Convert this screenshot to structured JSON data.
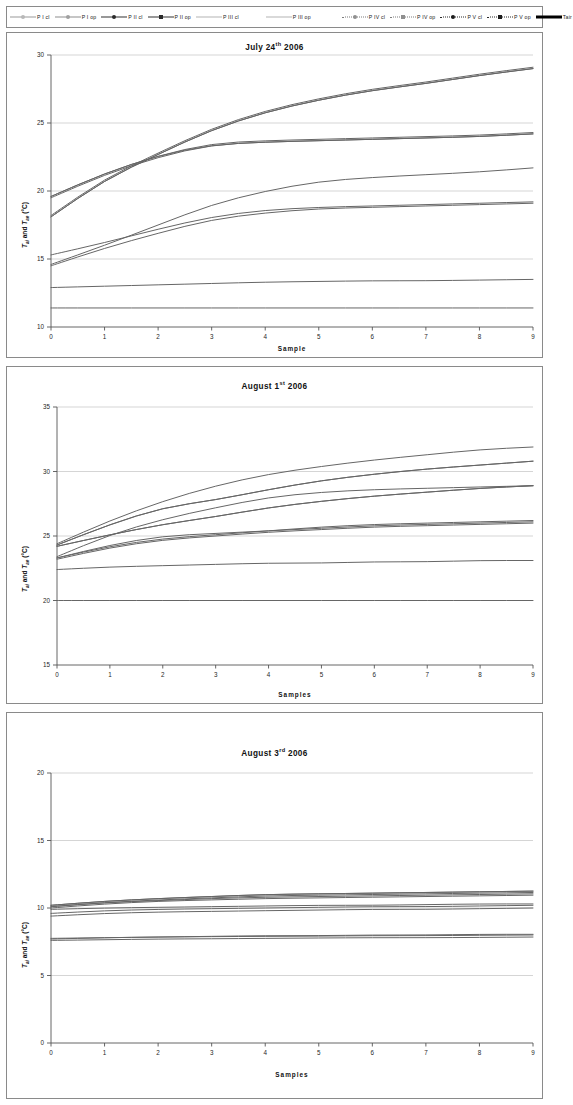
{
  "legend": {
    "items": [
      {
        "label": "P I cl",
        "marker": "circle",
        "fill": "#b8b8b8",
        "line": "solid",
        "color": "#9a9a9a",
        "width": 0.8
      },
      {
        "label": "P I op",
        "marker": "circle",
        "fill": "#a0a0a0",
        "line": "solid",
        "color": "#8d8d8d",
        "width": 0.8
      },
      {
        "label": "P II cl",
        "marker": "circle",
        "fill": "#2b2b2b",
        "line": "solid",
        "color": "#333333",
        "width": 1.2
      },
      {
        "label": "P II op",
        "marker": "square",
        "fill": "#2b2b2b",
        "line": "solid",
        "color": "#333333",
        "width": 1.2
      },
      {
        "label": "P III cl",
        "marker": "none",
        "fill": "#9f9f9f",
        "line": "solid",
        "color": "#b4b4b4",
        "width": 0.7
      },
      {
        "label": "P III op",
        "marker": "none",
        "fill": "#9f9f9f",
        "line": "solid",
        "color": "#b4b4b4",
        "width": 0.7
      },
      {
        "label": "P IV cl",
        "marker": "circle",
        "fill": "#8f8f8f",
        "line": "dotted",
        "color": "#7d7d7d",
        "width": 0.9
      },
      {
        "label": "P IV op",
        "marker": "square",
        "fill": "#8f8f8f",
        "line": "dotted",
        "color": "#7d7d7d",
        "width": 0.9
      },
      {
        "label": "P V cl",
        "marker": "circle",
        "fill": "#1c1c1c",
        "line": "dotted",
        "color": "#2a2a2a",
        "width": 1.0
      },
      {
        "label": "P V op",
        "marker": "square",
        "fill": "#1c1c1c",
        "line": "dotted",
        "color": "#2a2a2a",
        "width": 1.0
      },
      {
        "label": "Tair",
        "marker": "none",
        "fill": "#000000",
        "line": "solid",
        "color": "#000000",
        "width": 2.6
      }
    ]
  },
  "axis_label_text": {
    "y_prefix": "T",
    "y_sub1": "ai",
    "y_mid": " and ",
    "y_sub2": "ae",
    "y_unit": " (°C)"
  },
  "chart_data": [
    {
      "id": "chart1",
      "type": "line",
      "title_main": "July 24",
      "title_sup": "th",
      "title_year": " 2006",
      "title": "July 24th 2006",
      "xlabel": "Sample",
      "ylabel": "Tai and Tae (°C)",
      "x": [
        0,
        1,
        2,
        3,
        4,
        5,
        6,
        7,
        8,
        9
      ],
      "xlim": [
        0,
        9
      ],
      "ylim": [
        10,
        30
      ],
      "yticks": [
        10,
        15,
        20,
        25,
        30
      ],
      "xticks": [
        0,
        1,
        2,
        3,
        4,
        5,
        6,
        7,
        8,
        9
      ],
      "grid": true,
      "series": [
        {
          "name": "P I cl",
          "values": [
            19.6,
            21.3,
            22.6,
            23.5,
            23.7,
            23.8,
            23.9,
            24.0,
            24.1,
            24.3
          ]
        },
        {
          "name": "P I op",
          "values": [
            19.5,
            21.2,
            22.5,
            23.4,
            23.6,
            23.7,
            23.8,
            23.9,
            24.0,
            24.2
          ]
        },
        {
          "name": "P II cl",
          "values": [
            18.2,
            20.9,
            22.8,
            24.6,
            25.9,
            26.8,
            27.5,
            28.0,
            28.6,
            29.1
          ]
        },
        {
          "name": "P II op",
          "values": [
            18.1,
            20.8,
            22.7,
            24.5,
            25.8,
            26.7,
            27.4,
            27.9,
            28.5,
            29.0
          ]
        },
        {
          "name": "P III cl",
          "values": [
            19.6,
            21.3,
            22.6,
            23.4,
            23.6,
            23.7,
            23.8,
            23.9,
            24.0,
            24.2
          ]
        },
        {
          "name": "P III op",
          "values": [
            18.1,
            20.8,
            22.7,
            24.5,
            25.8,
            26.7,
            27.4,
            27.9,
            28.5,
            29.0
          ]
        },
        {
          "name": "P IV cl",
          "values": [
            14.6,
            16.0,
            17.5,
            19.0,
            20.0,
            20.7,
            21.0,
            21.2,
            21.4,
            21.7
          ]
        },
        {
          "name": "P IV op",
          "values": [
            15.3,
            16.2,
            17.2,
            18.1,
            18.6,
            18.8,
            18.9,
            19.0,
            19.1,
            19.2
          ]
        },
        {
          "name": "P V cl",
          "values": [
            14.5,
            15.8,
            16.9,
            17.9,
            18.4,
            18.7,
            18.8,
            18.9,
            19.0,
            19.1
          ]
        },
        {
          "name": "P V op",
          "values": [
            12.9,
            13.0,
            13.1,
            13.2,
            13.3,
            13.35,
            13.4,
            13.4,
            13.45,
            13.5
          ]
        },
        {
          "name": "Tair",
          "values": [
            11.4,
            11.4,
            11.4,
            11.4,
            11.4,
            11.4,
            11.4,
            11.4,
            11.4,
            11.4
          ]
        }
      ]
    },
    {
      "id": "chart2",
      "type": "line",
      "title_main": "August 1",
      "title_sup": "st",
      "title_year": " 2006",
      "title": "August 1st 2006",
      "xlabel": "Samples",
      "ylabel": "Tai and Tae (°C)",
      "x": [
        0,
        1,
        2,
        3,
        4,
        5,
        6,
        7,
        8,
        9
      ],
      "xlim": [
        0,
        9
      ],
      "ylim": [
        15,
        35
      ],
      "yticks": [
        15,
        20,
        25,
        30,
        35
      ],
      "xticks": [
        0,
        1,
        2,
        3,
        4,
        5,
        6,
        7,
        8,
        9
      ],
      "grid": true,
      "series": [
        {
          "name": "P I cl",
          "values": [
            24.3,
            25.9,
            27.2,
            27.8,
            28.6,
            29.3,
            29.8,
            30.2,
            30.5,
            30.8
          ]
        },
        {
          "name": "P I op",
          "values": [
            24.2,
            25.1,
            25.9,
            26.5,
            27.2,
            27.7,
            28.1,
            28.4,
            28.7,
            28.9
          ]
        },
        {
          "name": "P II cl",
          "values": [
            24.4,
            26.2,
            27.7,
            28.9,
            29.8,
            30.4,
            30.9,
            31.3,
            31.7,
            31.9
          ]
        },
        {
          "name": "P II op",
          "values": [
            23.3,
            24.2,
            24.8,
            25.1,
            25.4,
            25.7,
            25.9,
            26.0,
            26.1,
            26.2
          ]
        },
        {
          "name": "P III cl",
          "values": [
            24.2,
            25.1,
            25.9,
            26.5,
            27.2,
            27.7,
            28.1,
            28.4,
            28.7,
            28.9
          ]
        },
        {
          "name": "P III op",
          "values": [
            24.3,
            25.9,
            27.2,
            27.8,
            28.6,
            29.3,
            29.8,
            30.2,
            30.5,
            30.8
          ]
        },
        {
          "name": "P IV cl",
          "values": [
            23.3,
            24.3,
            25.0,
            25.2,
            25.4,
            25.6,
            25.8,
            25.9,
            26.0,
            26.1
          ]
        },
        {
          "name": "P IV op",
          "values": [
            23.2,
            24.1,
            24.7,
            25.0,
            25.3,
            25.5,
            25.7,
            25.8,
            25.9,
            26.0
          ]
        },
        {
          "name": "P V cl",
          "values": [
            23.4,
            25.1,
            26.3,
            27.2,
            28.0,
            28.4,
            28.6,
            28.7,
            28.8,
            28.9
          ]
        },
        {
          "name": "P V op",
          "values": [
            22.4,
            22.6,
            22.7,
            22.8,
            22.9,
            22.9,
            23.0,
            23.0,
            23.1,
            23.1
          ]
        },
        {
          "name": "Tair",
          "values": [
            20.0,
            20.0,
            20.0,
            20.0,
            20.0,
            20.0,
            20.0,
            20.0,
            20.0,
            20.0
          ]
        }
      ]
    },
    {
      "id": "chart3",
      "type": "line",
      "title_main": "August 3",
      "title_sup": "rd",
      "title_year": " 2006",
      "title": "August 3rd 2006",
      "xlabel": "Samples",
      "ylabel": "Tai and Tae (°C)",
      "x": [
        0,
        1,
        2,
        3,
        4,
        5,
        6,
        7,
        8,
        9
      ],
      "xlim": [
        0,
        9
      ],
      "ylim": [
        0,
        20
      ],
      "yticks": [
        0,
        5,
        10,
        15,
        20
      ],
      "xticks": [
        0,
        1,
        2,
        3,
        4,
        5,
        6,
        7,
        8,
        9
      ],
      "grid": true,
      "series": [
        {
          "name": "P I cl",
          "values": [
            10.2,
            10.5,
            10.7,
            10.85,
            11.0,
            11.05,
            11.1,
            11.15,
            11.2,
            11.25
          ]
        },
        {
          "name": "P I op",
          "values": [
            10.1,
            10.4,
            10.55,
            10.7,
            10.8,
            10.85,
            10.9,
            10.95,
            11.0,
            11.05
          ]
        },
        {
          "name": "P II cl",
          "values": [
            10.2,
            10.5,
            10.7,
            10.85,
            11.0,
            11.05,
            11.1,
            11.15,
            11.2,
            11.25
          ]
        },
        {
          "name": "P II op",
          "values": [
            9.9,
            10.0,
            10.05,
            10.1,
            10.15,
            10.2,
            10.2,
            10.25,
            10.3,
            10.3
          ]
        },
        {
          "name": "P III cl",
          "values": [
            10.0,
            10.3,
            10.5,
            10.6,
            10.7,
            10.75,
            10.8,
            10.85,
            10.9,
            10.95
          ]
        },
        {
          "name": "P III op",
          "values": [
            10.1,
            10.4,
            10.6,
            10.75,
            10.9,
            10.95,
            11.0,
            11.05,
            11.1,
            11.15
          ]
        },
        {
          "name": "P IV cl",
          "values": [
            9.6,
            9.8,
            9.9,
            9.95,
            10.0,
            10.05,
            10.1,
            10.1,
            10.15,
            10.2
          ]
        },
        {
          "name": "P IV op",
          "values": [
            9.4,
            9.6,
            9.7,
            9.75,
            9.8,
            9.85,
            9.9,
            9.9,
            9.95,
            10.0
          ]
        },
        {
          "name": "P V cl",
          "values": [
            7.7,
            7.8,
            7.85,
            7.9,
            7.95,
            7.95,
            8.0,
            8.0,
            8.05,
            8.05
          ]
        },
        {
          "name": "P V op",
          "values": [
            7.6,
            7.65,
            7.7,
            7.72,
            7.75,
            7.78,
            7.8,
            7.8,
            7.82,
            7.85
          ]
        },
        {
          "name": "Tair",
          "values": [
            7.75,
            7.8,
            7.85,
            7.88,
            7.9,
            7.92,
            7.95,
            7.95,
            7.98,
            8.0
          ]
        }
      ]
    }
  ]
}
